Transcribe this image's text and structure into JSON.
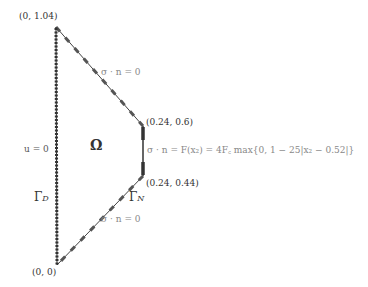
{
  "diagram": {
    "vertices": [
      {
        "label": "(0, 1.04)",
        "x": 56,
        "y": 27
      },
      {
        "label": "(0.24, 0.6)",
        "x": 143,
        "y": 126
      },
      {
        "label": "(0.24, 0.44)",
        "x": 143,
        "y": 176
      },
      {
        "label": "(0, 0)",
        "x": 57,
        "y": 265
      }
    ],
    "domain_label": "Ω",
    "dirichlet": {
      "condition": "u = 0",
      "boundary": "Γ",
      "boundary_sub": "D"
    },
    "neumann": {
      "boundary": "Γ",
      "boundary_sub": "N"
    },
    "top_edge_condition": "σ · n = 0",
    "bottom_edge_condition": "σ · n = 0",
    "right_edge_condition": "σ · n = F(x₂) = 4F꜀ max{0, 1 − 25|x₂ − 0.52|}",
    "colors": {
      "edge": "#333333",
      "dash": "#555555",
      "text": "#333333",
      "grey_text": "#888888"
    }
  }
}
